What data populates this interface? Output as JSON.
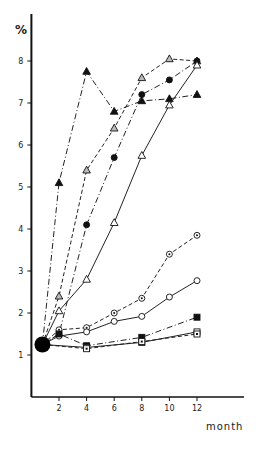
{
  "chart_data": {
    "type": "line",
    "title": "",
    "xlabel": "month",
    "ylabel": "%",
    "x_ticks": [
      2,
      4,
      6,
      8,
      10,
      12
    ],
    "y_ticks": [
      1,
      2,
      3,
      4,
      5,
      6,
      7,
      8
    ],
    "xlim": [
      0,
      15
    ],
    "ylim": [
      0,
      8.6
    ],
    "grid": false,
    "legend": "none",
    "start_point": {
      "x": 0.8,
      "y": 1.25,
      "marker": "large-filled-circle"
    },
    "series": [
      {
        "name": "filled-triangle",
        "marker": "filled-triangle",
        "line": "dashdot",
        "x": [
          0.8,
          2,
          4,
          6,
          8,
          10,
          12
        ],
        "values": [
          1.25,
          5.1,
          7.75,
          6.8,
          7.05,
          7.1,
          7.2
        ]
      },
      {
        "name": "shaded-triangle",
        "marker": "shaded-triangle",
        "line": "dashed",
        "x": [
          0.8,
          2,
          4,
          6,
          8,
          10,
          12
        ],
        "values": [
          1.25,
          2.4,
          5.4,
          6.4,
          7.6,
          8.05,
          8.0
        ]
      },
      {
        "name": "filled-circle",
        "marker": "filled-circle",
        "line": "dashdot",
        "x": [
          0.8,
          2,
          4,
          6,
          8,
          10,
          12
        ],
        "values": [
          1.25,
          1.5,
          4.1,
          5.7,
          7.2,
          7.55,
          8.0
        ]
      },
      {
        "name": "open-triangle",
        "marker": "open-triangle",
        "line": "solid",
        "x": [
          0.8,
          2,
          4,
          6,
          8,
          10,
          12
        ],
        "values": [
          1.25,
          2.05,
          2.8,
          4.15,
          5.75,
          6.95,
          7.9
        ]
      },
      {
        "name": "dotted-circle",
        "marker": "dotted-circle",
        "line": "dashed",
        "x": [
          0.8,
          2,
          4,
          6,
          8,
          10,
          12
        ],
        "values": [
          1.25,
          1.6,
          1.65,
          2.0,
          2.35,
          3.4,
          3.85
        ]
      },
      {
        "name": "open-circle",
        "marker": "open-circle",
        "line": "solid",
        "x": [
          0.8,
          2,
          4,
          6,
          8,
          10,
          12
        ],
        "values": [
          1.25,
          1.45,
          1.55,
          1.8,
          1.92,
          2.38,
          2.77
        ]
      },
      {
        "name": "filled-square",
        "marker": "filled-square",
        "line": "dashdot",
        "x": [
          0.8,
          2,
          4,
          8,
          12
        ],
        "values": [
          1.25,
          1.5,
          1.22,
          1.42,
          1.9
        ]
      },
      {
        "name": "open-square",
        "marker": "open-square",
        "line": "solid",
        "x": [
          0.8,
          4,
          8,
          12
        ],
        "values": [
          1.25,
          1.18,
          1.3,
          1.55
        ]
      },
      {
        "name": "dotted-square",
        "marker": "dotted-square",
        "line": "dashed",
        "x": [
          0.8,
          4,
          8,
          12
        ],
        "values": [
          1.25,
          1.15,
          1.32,
          1.5
        ]
      }
    ]
  }
}
